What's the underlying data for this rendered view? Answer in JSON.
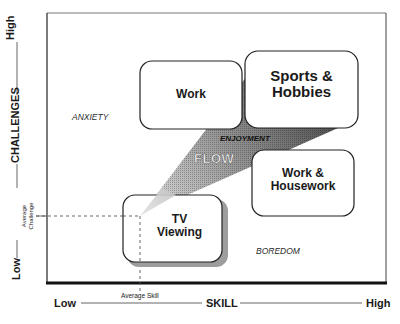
{
  "diagram": {
    "type": "flow-experience-map",
    "axes": {
      "x": {
        "title": "SKILL",
        "low": "Low",
        "high": "High",
        "marker": "Average Skill"
      },
      "y": {
        "title": "CHALLENGES",
        "low": "Low",
        "high": "High",
        "marker": "Average Challenge"
      }
    },
    "regions": {
      "anxiety": "ANXIETY",
      "enjoyment": "ENJOYMENT",
      "flow": "FLOW",
      "boredom": "BOREDOM"
    },
    "activities": [
      {
        "label_line1": "Work",
        "label_line2": ""
      },
      {
        "label_line1": "Sports &",
        "label_line2": "Hobbies"
      },
      {
        "label_line1": "Work &",
        "label_line2": "Housework"
      },
      {
        "label_line1": "TV",
        "label_line2": "Viewing"
      }
    ],
    "colors": {
      "frame": "#2a2a2a",
      "flow_wedge_dark": "#555555",
      "flow_wedge_light": "#d0d0d0",
      "box_fill": "#ffffff",
      "shadow": "#9a9a9a"
    }
  }
}
